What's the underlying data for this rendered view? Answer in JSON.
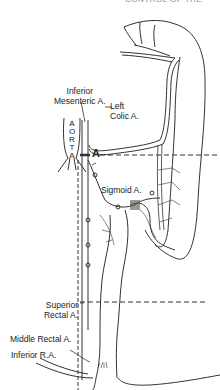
{
  "header_fragment": "CONTROL OF THE",
  "labels": {
    "inferior_mesenteric": [
      "Inferior",
      "Mesenteric A."
    ],
    "left_colic": [
      "Left",
      "Colic A."
    ],
    "aorta": [
      "A",
      "O",
      "R",
      "T",
      "A"
    ],
    "sigmoid": "Sigmoid A.",
    "superior_rectal": [
      "Superior",
      "Rectal A."
    ],
    "middle_rectal": "Middle Rectal A.",
    "inferior_rectal": "Inferior R.A.",
    "ligation_marker": "A"
  },
  "colors": {
    "line": "#333333",
    "background": "#ffffff"
  }
}
